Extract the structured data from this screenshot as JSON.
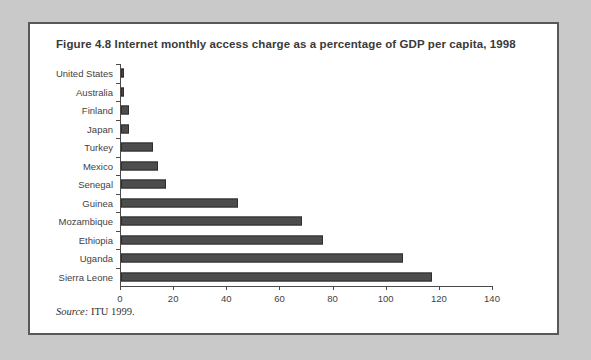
{
  "figure": {
    "title": "Figure 4.8  Internet monthly access charge as a percentage of GDP per capita, 1998",
    "source_label": "Source:",
    "source_text": " ITU 1999.",
    "frame_color": "#58585a",
    "background_color": "#c9c9c9",
    "panel_color": "#ffffff"
  },
  "chart_data": {
    "type": "bar",
    "orientation": "horizontal",
    "title": "Figure 4.8  Internet monthly access charge as a percentage of GDP per capita, 1998",
    "xlabel": "",
    "ylabel": "",
    "xlim": [
      0,
      140
    ],
    "xticks": [
      0,
      20,
      40,
      60,
      80,
      100,
      120,
      140
    ],
    "tick_labels": [
      "0",
      "20",
      "40",
      "60",
      "80",
      "100",
      "120",
      "140"
    ],
    "grid": false,
    "legend": false,
    "bar_color": "#4d4d4d",
    "bar_edge_color": "#2e2e2e",
    "categories": [
      "United States",
      "Australia",
      "Finland",
      "Japan",
      "Turkey",
      "Mexico",
      "Senegal",
      "Guinea",
      "Mozambique",
      "Ethiopia",
      "Uganda",
      "Sierra Leone"
    ],
    "values": [
      1,
      1,
      3,
      3,
      12,
      14,
      17,
      44,
      68,
      76,
      106,
      117
    ]
  }
}
